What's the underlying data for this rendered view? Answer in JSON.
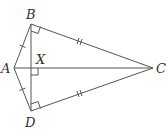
{
  "diagram": {
    "type": "kite-geometry",
    "stroke_color": "#555555",
    "label_color": "#333333",
    "points": {
      "A": {
        "label": "A",
        "x": 14,
        "y": 68
      },
      "B": {
        "label": "B",
        "x": 31,
        "y": 24
      },
      "C": {
        "label": "C",
        "x": 153,
        "y": 68
      },
      "D": {
        "label": "D",
        "x": 31,
        "y": 111
      },
      "X": {
        "label": "X",
        "x": 31,
        "y": 68
      }
    },
    "segments": [
      "AB",
      "AD",
      "BC",
      "DC",
      "AC",
      "BD"
    ],
    "right_angles": [
      "B",
      "D",
      "X"
    ],
    "tick_marks": {
      "AB": 1,
      "AD": 1,
      "BC": 2,
      "DC": 2
    }
  }
}
